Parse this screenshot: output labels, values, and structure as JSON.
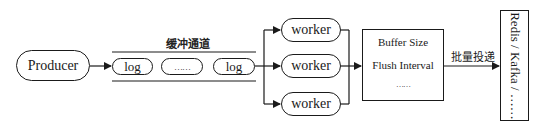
{
  "diagram": {
    "producer": {
      "label": "Producer"
    },
    "buffer_channel": {
      "title": "缓冲通道",
      "items": [
        {
          "label": "log"
        },
        {
          "label": "……"
        },
        {
          "label": "log"
        }
      ]
    },
    "workers": [
      {
        "label": "worker"
      },
      {
        "label": "worker"
      },
      {
        "label": "worker"
      }
    ],
    "batch_config": {
      "lines": [
        "Buffer Size",
        "Flush Interval",
        "……"
      ]
    },
    "delivery_edge": {
      "label": "批量投递"
    },
    "sink": {
      "label": "Redis / Kafka / ……"
    },
    "colors": {
      "stroke": "#1a1a1a",
      "background": "#ffffff"
    }
  }
}
